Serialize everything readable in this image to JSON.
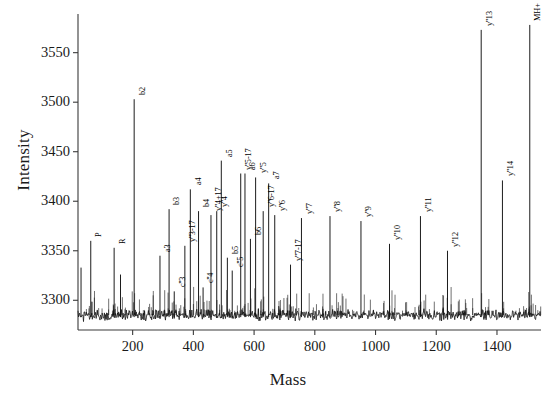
{
  "chart_data": {
    "type": "line",
    "title": "",
    "xlabel": "Mass",
    "ylabel": "Intensity",
    "xlim": [
      20,
      1545
    ],
    "ylim": [
      3270,
      3585
    ],
    "xticks": [
      200,
      400,
      600,
      800,
      1000,
      1200,
      1400
    ],
    "yticks": [
      3300,
      3350,
      3400,
      3450,
      3500,
      3550
    ],
    "grid": false,
    "legend": null,
    "baseline": 3285,
    "noise_amplitude": 6,
    "series": [
      {
        "name": "MALDI peptide fragment spectrum",
        "peaks": [
          {
            "label": "",
            "mass": 30,
            "intensity": 3333
          },
          {
            "label": "P",
            "mass": 62,
            "intensity": 3360
          },
          {
            "label": "R",
            "mass": 139,
            "intensity": 3353
          },
          {
            "label": "",
            "mass": 160,
            "intensity": 3326
          },
          {
            "label": "b2",
            "mass": 205,
            "intensity": 3503
          },
          {
            "label": "a3",
            "mass": 290,
            "intensity": 3345
          },
          {
            "label": "b3",
            "mass": 320,
            "intensity": 3392
          },
          {
            "label": "c''3",
            "mass": 337,
            "intensity": 3309
          },
          {
            "label": "y''3-17",
            "mass": 372,
            "intensity": 3355
          },
          {
            "label": "a4",
            "mass": 390,
            "intensity": 3412
          },
          {
            "label": "b4",
            "mass": 417,
            "intensity": 3390
          },
          {
            "label": "c''4",
            "mass": 432,
            "intensity": 3313
          },
          {
            "label": "y''4+17",
            "mass": 458,
            "intensity": 3386
          },
          {
            "label": "y''4",
            "mass": 477,
            "intensity": 3390
          },
          {
            "label": "a5",
            "mass": 492,
            "intensity": 3441
          },
          {
            "label": "b5",
            "mass": 512,
            "intensity": 3343
          },
          {
            "label": "c''5",
            "mass": 528,
            "intensity": 3330
          },
          {
            "label": "y''5-17",
            "mass": 556,
            "intensity": 3428
          },
          {
            "label": "a6",
            "mass": 570,
            "intensity": 3428
          },
          {
            "label": "b6",
            "mass": 588,
            "intensity": 3362
          },
          {
            "label": "y''5",
            "mass": 605,
            "intensity": 3424
          },
          {
            "label": "y''6-17",
            "mass": 630,
            "intensity": 3390
          },
          {
            "label": "a7",
            "mass": 648,
            "intensity": 3418
          },
          {
            "label": "y''6",
            "mass": 668,
            "intensity": 3386
          },
          {
            "label": "y''7-17",
            "mass": 720,
            "intensity": 3336
          },
          {
            "label": "y''7",
            "mass": 756,
            "intensity": 3383
          },
          {
            "label": "y''8",
            "mass": 850,
            "intensity": 3385
          },
          {
            "label": "y''9",
            "mass": 952,
            "intensity": 3380
          },
          {
            "label": "y''10",
            "mass": 1046,
            "intensity": 3357
          },
          {
            "label": "y''11",
            "mass": 1148,
            "intensity": 3385
          },
          {
            "label": "y''12",
            "mass": 1237,
            "intensity": 3350
          },
          {
            "label": "y''13",
            "mass": 1348,
            "intensity": 3573
          },
          {
            "label": "y''14",
            "mass": 1418,
            "intensity": 3421
          },
          {
            "label": "MH+",
            "mass": 1508,
            "intensity": 3578
          }
        ]
      }
    ]
  },
  "axes": {
    "xlabel": "Mass",
    "ylabel": "Intensity",
    "xtick_labels": [
      "200",
      "400",
      "600",
      "800",
      "1000",
      "1200",
      "1400"
    ],
    "ytick_labels": [
      "3300",
      "3350",
      "3400",
      "3450",
      "3500",
      "3550"
    ]
  },
  "style": {
    "trace_color": "#101010",
    "axis_color": "#3a3a3a",
    "background": "#ffffff"
  }
}
